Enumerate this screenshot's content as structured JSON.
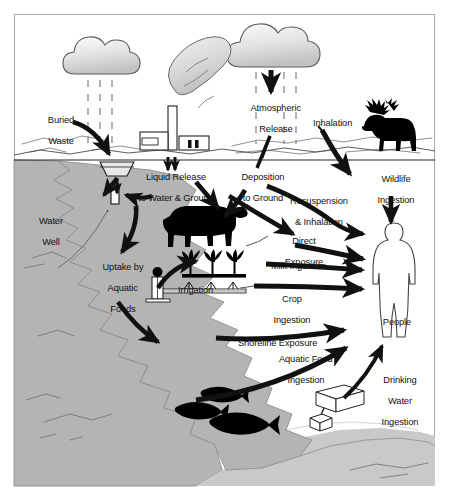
{
  "diagram": {
    "type": "pathway-diagram",
    "colors": {
      "border": "#a8a8a8",
      "background": "#ffffff",
      "water": "#b4b4b4",
      "water_stroke": "#8e8e8e",
      "cloud_fill": "#d9d9d9",
      "cloud_stroke": "#5a5a5a",
      "silhouette": "#000000",
      "arrow": "#111111",
      "text": "#111111",
      "terrain_line": "#6b6b6b"
    },
    "labels": {
      "buried_waste": "Buried\nWaste",
      "atmospheric_release": "Atmospheric\nRelease",
      "inhalation": "Inhalation",
      "wildlife_ingestion": "Wildlife\nIngestion",
      "liquid_release": "Liquid Release\nto Water & Ground",
      "deposition_to_ground": "Deposition\nto Ground",
      "resuspension_inhalation": "Resuspension\n& Inhalation",
      "water_well": "Water\nWell",
      "direct_exposure": "Direct\nExposure",
      "uptake_aquatic_foods": "Uptake by\nAquatic\nFoods",
      "milk_ingestion": "Milk Ingestion",
      "irrigation": "Irrigation",
      "crop_ingestion": "Crop\nIngestion",
      "shoreline_exposure": "Shoreline Exposure",
      "people": "People",
      "aquatic_food_ingestion": "Aquatic Food\nIngestion",
      "drinking_water_ingestion": "Drinking\nWater\nIngestion"
    },
    "label_lines": {
      "buried_waste": [
        "Buried",
        "Waste"
      ],
      "atmospheric_release": [
        "Atmospheric",
        "Release"
      ],
      "inhalation": [
        "Inhalation"
      ],
      "wildlife_ingestion": [
        "Wildlife",
        "Ingestion"
      ],
      "liquid_release": [
        "Liquid Release",
        "to Water & Ground"
      ],
      "deposition_to_ground": [
        "Deposition",
        "to Ground"
      ],
      "resuspension_inhalation": [
        "Resuspension",
        "& Inhalation"
      ],
      "water_well": [
        "Water",
        "Well"
      ],
      "direct_exposure": [
        "Direct",
        "Exposure"
      ],
      "uptake_aquatic_foods": [
        "Uptake by",
        "Aquatic",
        "Foods"
      ],
      "milk_ingestion": [
        "Milk Ingestion"
      ],
      "irrigation": [
        "Irrigation"
      ],
      "crop_ingestion": [
        "Crop",
        "Ingestion"
      ],
      "shoreline_exposure": [
        "Shoreline Exposure"
      ],
      "people": [
        "People"
      ],
      "aquatic_food_ingestion": [
        "Aquatic Food",
        "Ingestion"
      ],
      "drinking_water_ingestion": [
        "Drinking",
        "Water",
        "Ingestion"
      ]
    },
    "objects": [
      {
        "name": "cloud-left",
        "kind": "cloud",
        "note": "rain cloud over buried waste"
      },
      {
        "name": "cloud-right",
        "kind": "cloud",
        "note": "rain cloud with atmospheric release arrow"
      },
      {
        "name": "factory",
        "kind": "industrial-facility",
        "note": "buildings with smokestack and plume"
      },
      {
        "name": "smoke-plume",
        "kind": "plume"
      },
      {
        "name": "buried-waste-container",
        "kind": "trapezoid-trench"
      },
      {
        "name": "water-well",
        "kind": "well-pipe"
      },
      {
        "name": "moose",
        "kind": "wildlife-silhouette"
      },
      {
        "name": "cow",
        "kind": "livestock-silhouette"
      },
      {
        "name": "crops",
        "kind": "crop-row"
      },
      {
        "name": "irrigation-pump",
        "kind": "pump"
      },
      {
        "name": "fish-1",
        "kind": "fish-silhouette"
      },
      {
        "name": "fish-2",
        "kind": "fish-silhouette"
      },
      {
        "name": "fish-3",
        "kind": "fish-silhouette"
      },
      {
        "name": "water-intake-structure",
        "kind": "pump-house"
      },
      {
        "name": "person",
        "kind": "human-outline"
      },
      {
        "name": "river",
        "kind": "water-body"
      }
    ]
  }
}
